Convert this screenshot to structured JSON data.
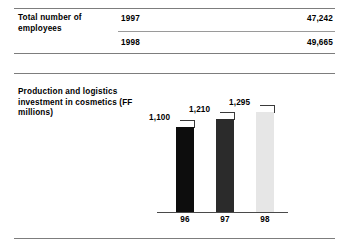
{
  "table": {
    "row_label": "Total number of employees",
    "rows": [
      {
        "year": "1997",
        "value": "47,242"
      },
      {
        "year": "1998",
        "value": "49,665"
      }
    ]
  },
  "chart_section": {
    "title": "Production and logistics investment in cosmetics (FF millions)"
  },
  "chart_data": {
    "type": "bar",
    "title": "Production and logistics investment in cosmetics (FF millions)",
    "xlabel": "",
    "ylabel": "FF millions",
    "categories": [
      "96",
      "97",
      "98"
    ],
    "values": [
      1100,
      1210,
      1295
    ],
    "value_labels": [
      "1,100",
      "1,210",
      "1,295"
    ],
    "ylim": [
      0,
      1400
    ],
    "grid": false,
    "legend": "none",
    "bar_colors": [
      "#0d0d0d",
      "#2b2b2b",
      "#e6e6e6"
    ]
  },
  "colors": {
    "rule": "#7d7d7d",
    "axis": "#4a4a4a",
    "text": "#000000",
    "background": "#ffffff"
  }
}
